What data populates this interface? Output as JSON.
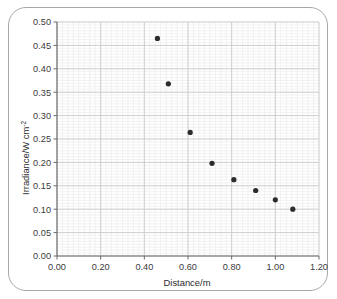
{
  "figure": {
    "frame_color": "#a8a8a8",
    "background_color": "#ffffff"
  },
  "chart_data": {
    "type": "scatter",
    "title": "",
    "xlabel": "Distance/m",
    "ylabel": "Irradiance/W cm",
    "ylabel_exponent": "-2",
    "xlim": [
      0.0,
      1.2
    ],
    "ylim": [
      0.0,
      0.5
    ],
    "x_major_step": 0.2,
    "y_major_step": 0.05,
    "x_minor_step": 0.025,
    "y_minor_step": 0.00625,
    "grid": true,
    "grid_major_color": "#c9c9c9",
    "grid_minor_color": "#ececec",
    "legend": "none",
    "marker_color": "#2b2b2b",
    "marker_size_px": 5.2,
    "xticklabels": [
      "0.00",
      "0.20",
      "0.40",
      "0.60",
      "0.80",
      "1.00",
      "1.20"
    ],
    "xticks": [
      0.0,
      0.2,
      0.4,
      0.6,
      0.8,
      1.0,
      1.2
    ],
    "yticklabels": [
      "0.00",
      "0.05",
      "0.10",
      "0.15",
      "0.20",
      "0.25",
      "0.30",
      "0.35",
      "0.40",
      "0.45",
      "0.50"
    ],
    "yticks": [
      0.0,
      0.05,
      0.1,
      0.15,
      0.2,
      0.25,
      0.3,
      0.35,
      0.4,
      0.45,
      0.5
    ],
    "x": [
      0.46,
      0.51,
      0.61,
      0.71,
      0.81,
      0.91,
      1.0,
      1.08
    ],
    "y": [
      0.465,
      0.368,
      0.264,
      0.198,
      0.163,
      0.14,
      0.12,
      0.1
    ],
    "points": [
      {
        "x": 0.46,
        "y": 0.465
      },
      {
        "x": 0.51,
        "y": 0.368
      },
      {
        "x": 0.61,
        "y": 0.264
      },
      {
        "x": 0.71,
        "y": 0.198
      },
      {
        "x": 0.81,
        "y": 0.163
      },
      {
        "x": 0.91,
        "y": 0.14
      },
      {
        "x": 1.0,
        "y": 0.12
      },
      {
        "x": 1.08,
        "y": 0.1
      }
    ]
  }
}
